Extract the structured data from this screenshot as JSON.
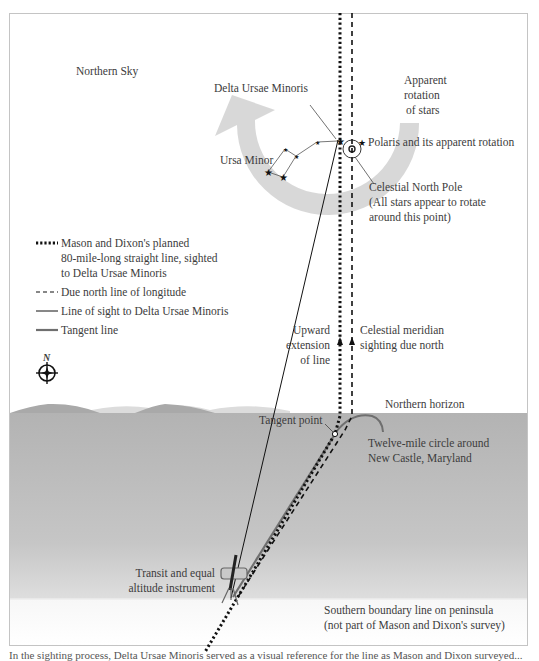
{
  "sky_label": "Northern Sky",
  "stars": {
    "delta_ursae_minoris": "Delta Ursae Minoris",
    "ursa_minor": "Ursa Minor",
    "polaris": "Polaris and its apparent rotation",
    "apparent_rotation": [
      "Apparent",
      "rotation",
      "of stars"
    ]
  },
  "pole": {
    "title": "Celestial North Pole",
    "note_line1": "(All stars appear to rotate",
    "note_line2": "around this point)"
  },
  "legend": {
    "items": [
      {
        "style": "dotted",
        "lines": [
          "Mason and Dixon's planned",
          "80-mile-long straight line, sighted",
          "to Delta Ursae Minoris"
        ]
      },
      {
        "style": "dashed",
        "lines": [
          "Due north line of longitude"
        ]
      },
      {
        "style": "solid-thin",
        "lines": [
          "Line of sight to Delta Ursae Minoris"
        ]
      },
      {
        "style": "solid-gray",
        "lines": [
          "Tangent line"
        ]
      }
    ]
  },
  "compass": {
    "label": "N"
  },
  "annotations": {
    "upward_extension": [
      "Upward",
      "extension",
      "of line"
    ],
    "meridian": [
      "Celestial meridian",
      "sighting due north"
    ],
    "northern_horizon": "Northern horizon",
    "tangent_point": "Tangent point",
    "twelve_mile": [
      "Twelve-mile circle around",
      "New Castle, Maryland"
    ],
    "instrument": [
      "Transit and equal",
      "altitude instrument"
    ],
    "southern_boundary": [
      "Southern boundary line on peninsula",
      "(not part of Mason and Dixon's survey)"
    ]
  },
  "caption": "In the sighting process, Delta Ursae Minoris served as a visual reference for the line as Mason and Dixon surveyed...",
  "colors": {
    "frame": "#bdbdbd",
    "ground": "#b4b4b4",
    "hills_dark": "#a8a8a8",
    "hills_light": "#d9d9d9",
    "rotation_arrow": "#d4d4d4",
    "tangent_line": "#6e6e6e",
    "ink": "#111111"
  }
}
